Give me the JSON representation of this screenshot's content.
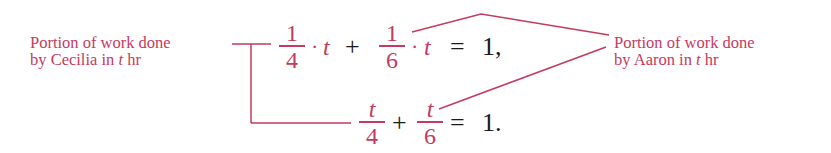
{
  "colors": {
    "annotation": "#c53a5e",
    "math": "#1a1a1a",
    "background": "#ffffff"
  },
  "left_label": {
    "line1": "Portion of work done",
    "line2_prefix": "by Cecilia in ",
    "line2_var": "t",
    "line2_suffix": " hr"
  },
  "right_label": {
    "line1": "Portion of work done",
    "line2_prefix": "by Aaron in ",
    "line2_var": "t",
    "line2_suffix": " hr"
  },
  "equation1": {
    "term1": {
      "numerator": "1",
      "denominator": "4"
    },
    "dot1": "·",
    "var1": "t",
    "plus": "+",
    "term2": {
      "numerator": "1",
      "denominator": "6"
    },
    "dot2": "·",
    "var2": "t",
    "equals": "=",
    "rhs": "1,"
  },
  "equation2": {
    "term1": {
      "numerator": "t",
      "denominator": "4"
    },
    "plus": "+",
    "term2": {
      "numerator": "t",
      "denominator": "6"
    },
    "equals": "=",
    "rhs": "1."
  }
}
